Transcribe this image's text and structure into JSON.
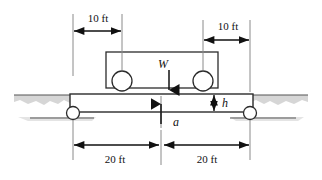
{
  "figure": {
    "type": "engineering-free-body-diagram",
    "colors": {
      "outline": "#2b2b2b",
      "dimension": "#111111",
      "extension": "#8a8a8a",
      "ground": "#555555",
      "embankment": "#d6d6d6",
      "background": "#ffffff"
    },
    "dimensions": {
      "top_left_label": "10 ft",
      "top_right_label": "10 ft",
      "bottom_left_label": "20 ft",
      "bottom_right_label": "20 ft"
    },
    "variables": {
      "load_label": "W",
      "height_label": "h",
      "acceleration_label": "a"
    },
    "elements": {
      "beam_name": "beam",
      "truck_name": "vehicle-body",
      "left_wheel_name": "vehicle-front-wheel",
      "right_wheel_name": "vehicle-rear-wheel",
      "left_support_name": "left-roller-support",
      "right_support_name": "right-roller-support",
      "left_embankment_name": "left-embankment",
      "right_embankment_name": "right-embankment"
    }
  }
}
